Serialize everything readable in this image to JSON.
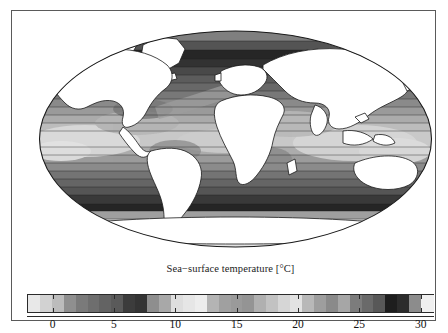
{
  "figure": {
    "kind": "map-figure",
    "background": "#ffffff",
    "frame_color": "#5a5a5a"
  },
  "map": {
    "projection": "mollweide",
    "land_color": "#ffffff",
    "land_outline": "#1a1a1a",
    "ellipse_outline": "#1a1a1a",
    "description": "Global sea-surface temperature shaded in greyscale contour bands"
  },
  "colorbar": {
    "title": "Sea−surface temperature [°C]",
    "units": "°C",
    "vmin": -2,
    "vmax": 31,
    "tick_labels": [
      "0",
      "5",
      "10",
      "15",
      "20",
      "25",
      "30"
    ],
    "tick_values": [
      0,
      5,
      10,
      15,
      20,
      25,
      30
    ],
    "band_colors": [
      "#e8e8e8",
      "#d2d2d2",
      "#bcbcbc",
      "#8f8f8f",
      "#7a7a7a",
      "#6e6e6e",
      "#636363",
      "#5a5a5a",
      "#3c3c3c",
      "#343434",
      "#8e8e8e",
      "#a8a8a8",
      "#dedede",
      "#e6e6e6",
      "#ededed",
      "#b4b4b4",
      "#a0a0a0",
      "#9a9a9a",
      "#949494",
      "#b0b0b0",
      "#c2c2c2",
      "#d6d6d6",
      "#e2e2e2",
      "#b8b8b8",
      "#9e9e9e",
      "#8a8a8a",
      "#a6a6a6",
      "#7c7c7c",
      "#6a6a6a",
      "#585858",
      "#1e1e1e",
      "#2c2c2c",
      "#8c8c8c",
      "#f0f0f0"
    ]
  },
  "chart_data": {
    "type": "heatmap",
    "title": "Sea−surface temperature [°C]",
    "xlabel": "",
    "ylabel": "",
    "legend_position": "bottom",
    "grid": false,
    "colorbar_range": [
      -2,
      31
    ],
    "colorbar_ticks": [
      0,
      5,
      10,
      15,
      20,
      25,
      30
    ],
    "colorbar_tick_labels": [
      "0",
      "5",
      "10",
      "15",
      "20",
      "25",
      "30"
    ],
    "colormap": "greyscale-discrete",
    "projection": "mollweide",
    "bands": [
      {
        "value": -2,
        "color": "#e8e8e8"
      },
      {
        "value": -1,
        "color": "#d2d2d2"
      },
      {
        "value": 0,
        "color": "#bcbcbc"
      },
      {
        "value": 1,
        "color": "#8f8f8f"
      },
      {
        "value": 2,
        "color": "#7a7a7a"
      },
      {
        "value": 3,
        "color": "#6e6e6e"
      },
      {
        "value": 4,
        "color": "#636363"
      },
      {
        "value": 5,
        "color": "#5a5a5a"
      },
      {
        "value": 6,
        "color": "#3c3c3c"
      },
      {
        "value": 7,
        "color": "#343434"
      },
      {
        "value": 8,
        "color": "#8e8e8e"
      },
      {
        "value": 9,
        "color": "#a8a8a8"
      },
      {
        "value": 10,
        "color": "#dedede"
      },
      {
        "value": 11,
        "color": "#e6e6e6"
      },
      {
        "value": 12,
        "color": "#ededed"
      },
      {
        "value": 13,
        "color": "#b4b4b4"
      },
      {
        "value": 14,
        "color": "#a0a0a0"
      },
      {
        "value": 15,
        "color": "#9a9a9a"
      },
      {
        "value": 16,
        "color": "#949494"
      },
      {
        "value": 17,
        "color": "#b0b0b0"
      },
      {
        "value": 18,
        "color": "#c2c2c2"
      },
      {
        "value": 19,
        "color": "#d6d6d6"
      },
      {
        "value": 20,
        "color": "#e2e2e2"
      },
      {
        "value": 21,
        "color": "#b8b8b8"
      },
      {
        "value": 22,
        "color": "#9e9e9e"
      },
      {
        "value": 23,
        "color": "#8a8a8a"
      },
      {
        "value": 24,
        "color": "#a6a6a6"
      },
      {
        "value": 25,
        "color": "#7c7c7c"
      },
      {
        "value": 26,
        "color": "#6a6a6a"
      },
      {
        "value": 27,
        "color": "#585858"
      },
      {
        "value": 28,
        "color": "#1e1e1e"
      },
      {
        "value": 29,
        "color": "#2c2c2c"
      },
      {
        "value": 30,
        "color": "#8c8c8c"
      },
      {
        "value": 31,
        "color": "#f0f0f0"
      }
    ],
    "latitude_bands": [
      {
        "lat_center": 0,
        "label": "equatorial",
        "approx_sst": 28
      },
      {
        "lat_center": 20,
        "label": "subtropical",
        "approx_sst": 24
      },
      {
        "lat_center": 40,
        "label": "midlatitude",
        "approx_sst": 15
      },
      {
        "lat_center": 60,
        "label": "subpolar",
        "approx_sst": 6
      },
      {
        "lat_center": 75,
        "label": "polar",
        "approx_sst": 0
      }
    ]
  }
}
